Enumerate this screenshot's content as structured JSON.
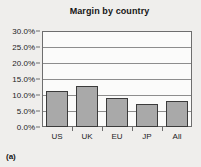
{
  "caption": "(a)",
  "chart_data": {
    "type": "bar",
    "title": "Margin by country",
    "xlabel": "",
    "ylabel": "",
    "categories": [
      "US",
      "UK",
      "EU",
      "JP",
      "All"
    ],
    "values": [
      11.1,
      12.9,
      9.0,
      7.3,
      8.2
    ],
    "tick_labels": [
      "0.0%",
      "5.0%",
      "10.0%",
      "15.0%",
      "20.0%",
      "25.0%",
      "30.0%"
    ],
    "tick_values": [
      0,
      5,
      10,
      15,
      20,
      25,
      30
    ],
    "ylim": [
      0,
      30
    ],
    "grid": true,
    "legend": "none",
    "bar_color": "#a9a9a9",
    "bar_border_color": "#3b3b3b",
    "axis_color": "#6e6e6e",
    "plot_background": "#fbfbfa",
    "figure_background": "#efeeec"
  }
}
